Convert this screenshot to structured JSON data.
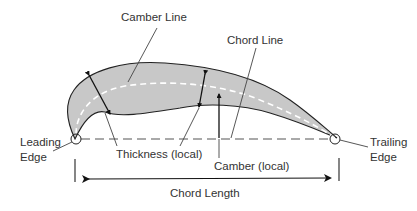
{
  "diagram": {
    "labels": {
      "camber_line": "Camber Line",
      "chord_line": "Chord Line",
      "leading_edge_1": "Leading",
      "leading_edge_2": "Edge",
      "trailing_edge_1": "Trailing",
      "trailing_edge_2": "Edge",
      "thickness": "Thickness (local)",
      "camber": "Camber (local)",
      "chord_length": "Chord Length"
    },
    "colors": {
      "airfoil_fill": "#c8c8c8",
      "outline": "#222222",
      "camber_line": "#ffffff",
      "chord_line": "#444444",
      "text": "#333333"
    }
  }
}
